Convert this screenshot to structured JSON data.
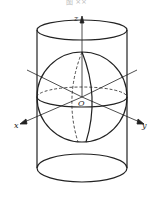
{
  "figure": {
    "caption": "图 ××",
    "labels": {
      "z": "z",
      "x": "x",
      "y": "y",
      "origin": "O"
    }
  }
}
